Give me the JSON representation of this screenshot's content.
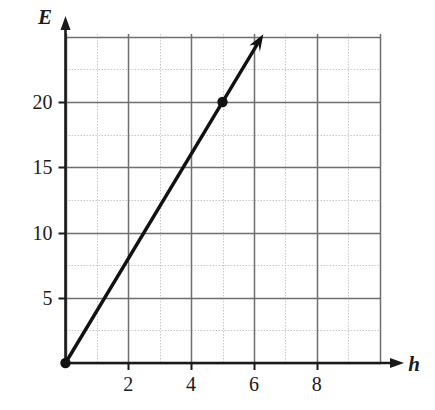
{
  "chart_data": {
    "type": "line",
    "title": "",
    "subtitle": "",
    "xlabel": "h",
    "ylabel": "E",
    "xlim": [
      0,
      10.2
    ],
    "ylim": [
      0,
      25.3
    ],
    "grid": true,
    "legend": null,
    "x_ticks": [
      2,
      4,
      6,
      8
    ],
    "x_tick_labels": [
      "2",
      "4",
      "6",
      "8"
    ],
    "y_ticks": [
      5,
      10,
      15,
      20
    ],
    "y_tick_labels": [
      "5",
      "10",
      "15",
      "20"
    ],
    "x_major_gridlines": [
      0,
      1,
      2,
      3,
      4,
      5,
      6,
      7,
      8,
      9,
      10
    ],
    "y_major_gridlines": [
      0,
      2.5,
      5,
      7.5,
      10,
      12.5,
      15,
      17.5,
      20,
      22.5,
      25
    ],
    "series": [
      {
        "name": "E vs h",
        "type": "line",
        "x": [
          0,
          5
        ],
        "y": [
          0,
          20
        ],
        "slope": 4,
        "intercept": 0,
        "equation": "E = 4h",
        "color": "#111111",
        "arrow_end": true,
        "arrow_tip": {
          "x": 6.3,
          "y": 25.2
        }
      }
    ],
    "points": [
      {
        "x": 0,
        "y": 0,
        "label": "",
        "marker": "filled-circle"
      },
      {
        "x": 5,
        "y": 20,
        "label": "",
        "marker": "filled-circle"
      }
    ],
    "colors": {
      "line": "#111111",
      "point": "#111111",
      "major_grid": "#6e6e6e",
      "minor_grid": "#c9c9c9",
      "axis": "#1a1a1a",
      "background": "#ffffff",
      "text": "#1a1a1a"
    }
  },
  "axes": {
    "y_axis_label": "E",
    "x_axis_label": "h"
  }
}
